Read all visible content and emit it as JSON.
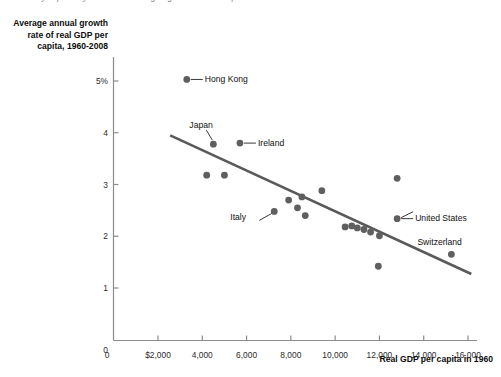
{
  "figure": {
    "cut_caption": "country separately. There is a strong negative relationship between ...",
    "y_axis_title": "Average annual growth rate of real GDP per capita, 1960-2008",
    "x_axis_title": "Real GDP per capita in 1960"
  },
  "chart_data": {
    "type": "scatter",
    "title": "",
    "xlabel": "Real GDP per capita in 1960",
    "ylabel": "Average annual growth rate of real GDP per capita, 1960-2008",
    "xlim": [
      0,
      16000
    ],
    "ylim": [
      0,
      5.4
    ],
    "grid": false,
    "legend": false,
    "xticks": [
      0,
      2000,
      4000,
      6000,
      8000,
      10000,
      12000,
      14000,
      16000
    ],
    "xtick_labels": [
      "0",
      "$2,000",
      "4,000",
      "6,000",
      "8,000",
      "10,000",
      "12,000",
      "14,000",
      "16,000"
    ],
    "yticks": [
      0,
      1,
      2,
      3,
      4,
      5
    ],
    "ytick_labels": [
      "0",
      "1",
      "2",
      "3",
      "4",
      "5%"
    ],
    "point_color": "#5f5f5f",
    "trendline_color": "#5a5a5a",
    "axis_color": "#8c8c8c",
    "points": [
      {
        "x": 3300,
        "y": 5.03,
        "label": "Hong Kong",
        "label_side": "right"
      },
      {
        "x": 4500,
        "y": 3.78,
        "label": "Japan",
        "label_side": "above"
      },
      {
        "x": 5700,
        "y": 3.8,
        "label": "Ireland",
        "label_side": "right"
      },
      {
        "x": 4200,
        "y": 3.18,
        "label": "",
        "label_side": ""
      },
      {
        "x": 5000,
        "y": 3.18,
        "label": "",
        "label_side": ""
      },
      {
        "x": 7250,
        "y": 2.48,
        "label": "Italy",
        "label_side": "left"
      },
      {
        "x": 7900,
        "y": 2.7,
        "label": "",
        "label_side": ""
      },
      {
        "x": 8300,
        "y": 2.55,
        "label": "",
        "label_side": ""
      },
      {
        "x": 8650,
        "y": 2.4,
        "label": "",
        "label_side": ""
      },
      {
        "x": 8500,
        "y": 2.76,
        "label": "",
        "label_side": ""
      },
      {
        "x": 9400,
        "y": 2.88,
        "label": "",
        "label_side": ""
      },
      {
        "x": 10450,
        "y": 2.18,
        "label": "",
        "label_side": ""
      },
      {
        "x": 10750,
        "y": 2.2,
        "label": "",
        "label_side": ""
      },
      {
        "x": 11000,
        "y": 2.16,
        "label": "",
        "label_side": ""
      },
      {
        "x": 11300,
        "y": 2.13,
        "label": "",
        "label_side": ""
      },
      {
        "x": 11600,
        "y": 2.08,
        "label": "",
        "label_side": ""
      },
      {
        "x": 12000,
        "y": 2.01,
        "label": "",
        "label_side": ""
      },
      {
        "x": 11950,
        "y": 1.42,
        "label": "",
        "label_side": ""
      },
      {
        "x": 12800,
        "y": 3.12,
        "label": "",
        "label_side": ""
      },
      {
        "x": 12800,
        "y": 2.34,
        "label": "United States",
        "label_side": "right"
      },
      {
        "x": 15250,
        "y": 1.65,
        "label": "Switzerland",
        "label_side": "above"
      }
    ],
    "trendline": {
      "x0": 2550,
      "y0": 3.95,
      "x1": 16150,
      "y1": 1.27
    }
  }
}
